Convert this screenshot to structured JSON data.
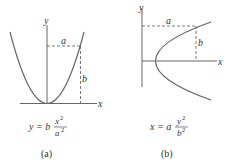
{
  "figure": {
    "panels": [
      {
        "id": "a",
        "caption": "(a)",
        "axis_x_label": "x",
        "axis_y_label": "y",
        "dim_horizontal": "a",
        "dim_vertical": "b",
        "equation": {
          "lhs": "y = b",
          "num": "x",
          "num_exp": "2",
          "den": "a",
          "den_exp": "2"
        }
      },
      {
        "id": "b",
        "caption": "(b)",
        "axis_x_label": "x",
        "axis_y_label": "y",
        "dim_horizontal": "a",
        "dim_vertical": "b",
        "equation": {
          "lhs": "x = a",
          "num": "y",
          "num_exp": "2",
          "den": "b",
          "den_exp": "2"
        }
      }
    ],
    "colors": {
      "line": "#555555",
      "text": "#333333"
    }
  }
}
